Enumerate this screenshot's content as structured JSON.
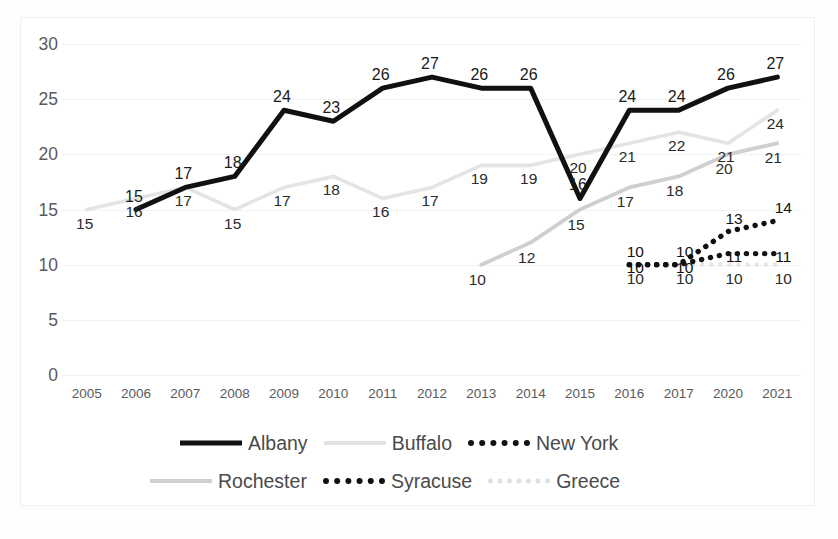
{
  "chart_data": {
    "type": "line",
    "title": "",
    "xlabel": "",
    "ylabel": "",
    "ylim": [
      0,
      30
    ],
    "yticks": [
      "0",
      "5",
      "10",
      "15",
      "20",
      "25",
      "30"
    ],
    "grid": true,
    "legend_position": "bottom",
    "categories": [
      "2005",
      "2006",
      "2007",
      "2008",
      "2009",
      "2010",
      "2011",
      "2012",
      "2013",
      "2014",
      "2015",
      "2016",
      "2017",
      "2020",
      "2021"
    ],
    "series": [
      {
        "name": "Albany",
        "color": "#111111",
        "style": "solid-thick",
        "values": [
          null,
          15,
          17,
          18,
          24,
          23,
          26,
          27,
          26,
          26,
          16,
          24,
          24,
          26,
          27
        ]
      },
      {
        "name": "Buffalo",
        "color": "#e4e4e4",
        "style": "solid-light",
        "values": [
          15,
          16,
          17,
          15,
          17,
          18,
          16,
          17,
          19,
          19,
          20,
          21,
          22,
          21,
          24
        ]
      },
      {
        "name": "New York",
        "color": "#111111",
        "style": "dotted",
        "values": [
          null,
          null,
          null,
          null,
          null,
          null,
          null,
          null,
          null,
          null,
          null,
          10,
          10,
          13,
          14
        ]
      },
      {
        "name": "Rochester",
        "color": "#cfcfcf",
        "style": "solid-mid",
        "values": [
          null,
          null,
          null,
          null,
          null,
          null,
          null,
          null,
          10,
          12,
          15,
          17,
          18,
          20,
          21
        ]
      },
      {
        "name": "Syracuse",
        "color": "#141414",
        "style": "dotted",
        "values": [
          null,
          null,
          null,
          null,
          null,
          null,
          null,
          null,
          null,
          null,
          null,
          10,
          10,
          11,
          11
        ]
      },
      {
        "name": "Greece",
        "color": "#e6e6e6",
        "style": "dotted-light",
        "values": [
          null,
          null,
          null,
          null,
          null,
          null,
          null,
          null,
          null,
          null,
          null,
          10,
          10,
          10,
          10
        ]
      }
    ]
  },
  "axis": {
    "y": [
      "30",
      "25",
      "20",
      "15",
      "10",
      "5",
      "0"
    ],
    "x": [
      "2005",
      "2006",
      "2007",
      "2008",
      "2009",
      "2010",
      "2011",
      "2012",
      "2013",
      "2014",
      "2015",
      "2016",
      "2017",
      "2020",
      "2021"
    ]
  },
  "legend": {
    "items": [
      {
        "label": "Albany",
        "swatch": "solid-black"
      },
      {
        "label": "Buffalo",
        "swatch": "solid-light"
      },
      {
        "label": "New York",
        "swatch": "dot-black"
      },
      {
        "label": "Rochester",
        "swatch": "solid-mid"
      },
      {
        "label": "Syracuse",
        "swatch": "dot-black"
      },
      {
        "label": "Greece",
        "swatch": "dot-light"
      }
    ]
  }
}
